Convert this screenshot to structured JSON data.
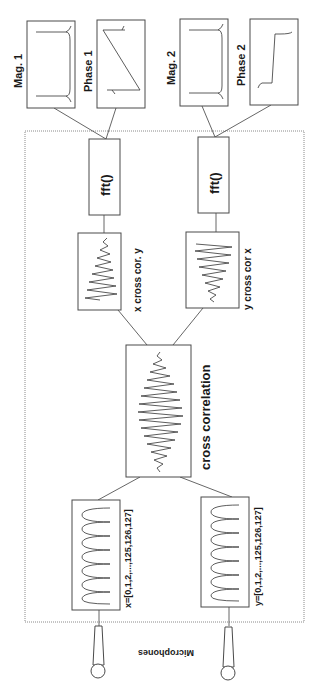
{
  "diagram": {
    "outputs": {
      "mag1": "Mag. 1",
      "phase1": "Phase 1",
      "mag2": "Mag. 2",
      "phase2": "Phase 2"
    },
    "fft": {
      "fft1": "fft()",
      "fft2": "fft()"
    },
    "partials": {
      "xy": "x cross cor. y",
      "yx": "y cross cor x"
    },
    "center": {
      "label": "cross correlation"
    },
    "inputs": {
      "x": "x=[0,1,2,...,125,126,127]",
      "y": "y=[0,1,2,...,125,126,127]"
    },
    "microphones": {
      "label": "Microphones"
    }
  },
  "colors": {
    "line": "#4a4a4a",
    "container": "#8a8a8a",
    "background": "#ffffff"
  }
}
